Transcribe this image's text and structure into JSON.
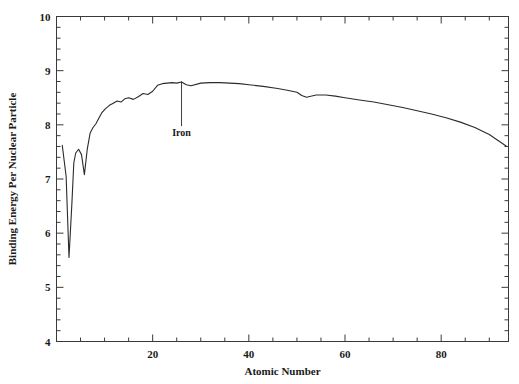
{
  "chart_data": {
    "type": "line",
    "title": "",
    "xlabel": "Atomic Number",
    "ylabel": "Binding Energy Per Nuclear Particle",
    "xlim": [
      0,
      94
    ],
    "ylim": [
      4,
      10
    ],
    "grid": false,
    "legend": "none",
    "x_major_ticks": [
      20,
      40,
      60,
      80
    ],
    "x_major_tick_labels": [
      "20",
      "40",
      "60",
      "80"
    ],
    "x_minor_tick_step": 5,
    "y_major_ticks": [
      4,
      5,
      6,
      7,
      8,
      9,
      10
    ],
    "y_major_tick_labels": [
      "4",
      "5",
      "6",
      "7",
      "8",
      "9",
      "10"
    ],
    "y_minor_tick_step": 0.2,
    "line_color": "#2b2b2b",
    "line_width": 1.1,
    "annotations": [
      {
        "text": "Iron",
        "x": 26,
        "y": 8.79,
        "label_x": 26,
        "label_y": 8.05,
        "leader": true
      }
    ],
    "series": [
      {
        "name": "Binding energy per nucleon",
        "x": [
          1.2,
          2.0,
          2.6,
          3.2,
          3.6,
          4.0,
          4.6,
          5.2,
          5.8,
          6.4,
          7.0,
          7.6,
          8.2,
          8.8,
          9.4,
          10.2,
          11.0,
          11.8,
          12.6,
          13.4,
          14.2,
          15.0,
          16.0,
          17.0,
          18.0,
          19.0,
          20.0,
          21.0,
          22.0,
          23.0,
          24.0,
          25.0,
          26.0,
          27.0,
          28.0,
          30.0,
          32.0,
          34.0,
          36.0,
          38.0,
          40.0,
          43.0,
          46.0,
          48.0,
          50.0,
          51.0,
          52.0,
          54.0,
          56.0,
          58.0,
          60.0,
          63.0,
          66.0,
          69.0,
          72.0,
          75.0,
          78.0,
          81.0,
          84.0,
          87.0,
          90.0,
          93.5
        ],
        "y": [
          7.62,
          7.05,
          5.55,
          6.55,
          7.3,
          7.48,
          7.55,
          7.45,
          7.08,
          7.55,
          7.85,
          7.95,
          8.02,
          8.12,
          8.22,
          8.3,
          8.36,
          8.4,
          8.44,
          8.42,
          8.48,
          8.5,
          8.47,
          8.52,
          8.58,
          8.56,
          8.62,
          8.73,
          8.76,
          8.77,
          8.78,
          8.77,
          8.79,
          8.74,
          8.72,
          8.77,
          8.78,
          8.78,
          8.77,
          8.76,
          8.74,
          8.71,
          8.67,
          8.64,
          8.6,
          8.54,
          8.51,
          8.55,
          8.55,
          8.53,
          8.5,
          8.46,
          8.42,
          8.37,
          8.32,
          8.26,
          8.2,
          8.13,
          8.05,
          7.95,
          7.82,
          7.61
        ]
      }
    ]
  },
  "caption": {
    "text": ""
  }
}
